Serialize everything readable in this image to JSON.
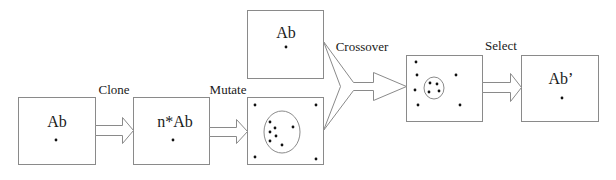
{
  "diagram": {
    "colors": {
      "stroke": "#8a8a8a",
      "dot": "#111111",
      "text": "#1a1a1a"
    },
    "boxes": [
      {
        "id": "antibody",
        "label": "Ab"
      },
      {
        "id": "clones",
        "label": "n*Ab"
      },
      {
        "id": "antibody-2",
        "label": "Ab"
      },
      {
        "id": "mutated",
        "label": ""
      },
      {
        "id": "crossover-result",
        "label": ""
      },
      {
        "id": "selected",
        "label": "Ab’"
      }
    ],
    "steps": [
      {
        "id": "clone",
        "label": "Clone"
      },
      {
        "id": "mutate",
        "label": "Mutate"
      },
      {
        "id": "crossover",
        "label": "Crossover"
      },
      {
        "id": "select",
        "label": "Select"
      }
    ]
  }
}
